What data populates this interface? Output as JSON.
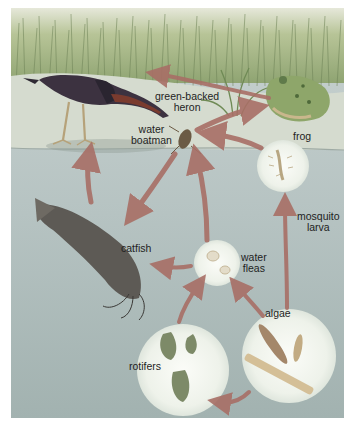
{
  "diagram": {
    "type": "food-web",
    "colors": {
      "grass_light": "#c9d3a2",
      "grass_dark": "#7f9363",
      "shore": "#d8dccb",
      "water_top": "#c7d1cf",
      "water_bottom": "#9fb0ae",
      "arrow": "#a86f66",
      "circle": "#f1f4ee",
      "heron_body": "#3c3240",
      "heron_neck": "#7a3b2e",
      "frog": "#8ea66a",
      "catfish": "#5d5a55"
    },
    "organisms": [
      {
        "id": "heron",
        "label": "green-backed\nheron",
        "line1": "green-backed",
        "line2": "heron"
      },
      {
        "id": "frog",
        "label": "frog"
      },
      {
        "id": "water_boatman",
        "line1": "water",
        "line2": "boatman"
      },
      {
        "id": "mosquito_larva",
        "line1": "mosquito",
        "line2": "larva"
      },
      {
        "id": "catfish",
        "label": "catfish"
      },
      {
        "id": "water_fleas",
        "line1": "water",
        "line2": "fleas"
      },
      {
        "id": "algae",
        "label": "algae"
      },
      {
        "id": "rotifers",
        "label": "rotifers"
      }
    ],
    "arrows": [
      {
        "from": "frog",
        "to": "heron"
      },
      {
        "from": "water_boatman",
        "to": "frog"
      },
      {
        "from": "mosquito_larva",
        "to": "water_boatman"
      },
      {
        "from": "catfish",
        "to": "heron"
      },
      {
        "from": "water_boatman",
        "to": "catfish"
      },
      {
        "from": "water_fleas",
        "to": "water_boatman"
      },
      {
        "from": "water_fleas",
        "to": "catfish"
      },
      {
        "from": "algae",
        "to": "water_fleas"
      },
      {
        "from": "algae",
        "to": "mosquito_larva"
      },
      {
        "from": "rotifers",
        "to": "water_fleas"
      },
      {
        "from": "algae",
        "to": "rotifers"
      }
    ]
  }
}
